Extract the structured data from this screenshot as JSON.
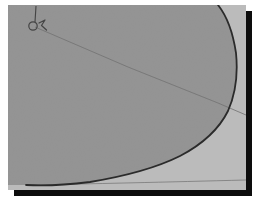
{
  "figure": {
    "title": "",
    "caption": "",
    "type": "grayscale-contour-diagram",
    "frame": {
      "plate_x": 8,
      "plate_y": 5,
      "plate_width": 238,
      "plate_height": 185,
      "shadow_offset_x": 6,
      "shadow_offset_y": 6,
      "shadow_color": "#0d0d0d",
      "background_color": "#ffffff"
    },
    "regions": [
      {
        "name": "inner-region",
        "label": "",
        "fill": "#8e8e8e",
        "description": "large darker grey lobe occupying the left and upper portion, bounded on the right by the heavy curved contour"
      },
      {
        "name": "outer-region",
        "label": "",
        "fill": "#b8b8b8",
        "description": "lighter grey background region to the right of and below the heavy contour"
      }
    ],
    "curves": [
      {
        "name": "primary-contour",
        "label": "",
        "stroke": "#1f1f1f",
        "stroke_width": 1.8,
        "style": "solid",
        "description": "heavy dark contour entering at the top edge, bulging right to its widest point near mid-height, then sweeping down-left to exit at the bottom edge",
        "points": [
          [
            210,
            0
          ],
          [
            214,
            6
          ],
          [
            219,
            16
          ],
          [
            223,
            28
          ],
          [
            226,
            41
          ],
          [
            228,
            54
          ],
          [
            229,
            66
          ],
          [
            229,
            78
          ],
          [
            227,
            90
          ],
          [
            223,
            102
          ],
          [
            217,
            113
          ],
          [
            209,
            123
          ],
          [
            199,
            133
          ],
          [
            187,
            142
          ],
          [
            173,
            150
          ],
          [
            158,
            157
          ],
          [
            141,
            163
          ],
          [
            122,
            169
          ],
          [
            102,
            174
          ],
          [
            80,
            177
          ],
          [
            55,
            179
          ],
          [
            32,
            180
          ],
          [
            18,
            180
          ]
        ]
      },
      {
        "name": "radial-line",
        "label": "",
        "stroke": "#6b6b6b",
        "stroke_width": 0.9,
        "style": "solid",
        "description": "thin faint straight ray from the small marker in the upper left, running down and to the right, crossing the primary contour and continuing to the right edge",
        "points": [
          [
            27,
            22
          ],
          [
            120,
            62
          ],
          [
            210,
            98
          ],
          [
            238,
            110
          ]
        ]
      },
      {
        "name": "baseline-edge",
        "label": "",
        "stroke": "#4a4a4a",
        "stroke_width": 0.9,
        "style": "solid",
        "description": "faint near-horizontal line along the very bottom of the plate",
        "points": [
          [
            18,
            180
          ],
          [
            80,
            179
          ],
          [
            160,
            177
          ],
          [
            238,
            175
          ]
        ]
      }
    ],
    "markers": [
      {
        "name": "origin-marker",
        "label": "",
        "shape": "circle",
        "cx": 25,
        "cy": 21,
        "r": 4.2,
        "stroke": "#3a3a3a",
        "fill": "none",
        "description": "small open circle symbol near the upper-left of the plate"
      },
      {
        "name": "leader-tick",
        "label": "",
        "shape": "line",
        "stroke": "#3a3a3a",
        "description": "short vertical leader line rising from the circle marker toward the top edge",
        "points": [
          [
            26,
            16
          ],
          [
            28,
            2
          ]
        ]
      },
      {
        "name": "marker-barb",
        "label": "",
        "shape": "polyline",
        "stroke": "#3a3a3a",
        "description": "small angled barb or arrow-like tick to the lower-right of the circle marker",
        "points": [
          [
            30,
            19
          ],
          [
            36,
            16
          ],
          [
            33,
            21
          ],
          [
            38,
            25
          ]
        ]
      }
    ],
    "axes": {
      "visible": false,
      "xlabel": "",
      "ylabel": "",
      "ticks": []
    },
    "legend": {
      "visible": false,
      "entries": []
    },
    "annotations": []
  },
  "colors": {
    "page_background": "#ffffff",
    "inner_region": "#8e8e8e",
    "outer_region": "#b8b8b8",
    "contour": "#1f1f1f",
    "thin_line": "#6b6b6b",
    "shadow": "#0d0d0d"
  }
}
